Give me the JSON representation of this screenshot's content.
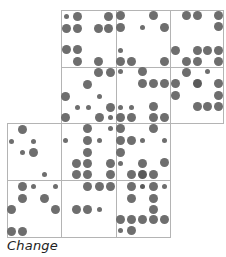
{
  "caption": "Change",
  "colors": {
    "dot": "#6e6e6e",
    "dot_dark": "#5a5a5a",
    "border": "#b4b4b4",
    "background": "#ffffff"
  },
  "cells": [
    {
      "id": "r1c2",
      "x": 61,
      "y": 10,
      "w": 55,
      "h": 57,
      "dots": [
        [
          66,
          16,
          "s"
        ],
        [
          77,
          16,
          "l"
        ],
        [
          108,
          16,
          "l"
        ],
        [
          66,
          28,
          "l"
        ],
        [
          77,
          28,
          "l"
        ],
        [
          98,
          28,
          "l"
        ],
        [
          108,
          28,
          "l"
        ],
        [
          66,
          49,
          "l"
        ],
        [
          77,
          49,
          "l"
        ],
        [
          77,
          61,
          "l"
        ],
        [
          98,
          61,
          "l"
        ]
      ]
    },
    {
      "id": "r1c3",
      "x": 116,
      "y": 10,
      "w": 54,
      "h": 57,
      "dots": [
        [
          120,
          15,
          "l"
        ],
        [
          153,
          15,
          "l"
        ],
        [
          120,
          27,
          "l"
        ],
        [
          142,
          27,
          "s"
        ],
        [
          164,
          27,
          "l"
        ],
        [
          120,
          50,
          "s"
        ],
        [
          120,
          61,
          "l"
        ],
        [
          131,
          61,
          "l"
        ],
        [
          164,
          61,
          "l"
        ]
      ]
    },
    {
      "id": "r1c4",
      "x": 170,
      "y": 10,
      "w": 53,
      "h": 57,
      "dots": [
        [
          186,
          15,
          "l"
        ],
        [
          197,
          15,
          "l"
        ],
        [
          218,
          15,
          "l"
        ],
        [
          218,
          26,
          "l"
        ],
        [
          175,
          50,
          "l"
        ],
        [
          197,
          50,
          "l"
        ],
        [
          207,
          50,
          "l"
        ],
        [
          218,
          50,
          "l"
        ],
        [
          186,
          61,
          "l"
        ],
        [
          197,
          61,
          "l"
        ],
        [
          218,
          61,
          "l"
        ]
      ]
    },
    {
      "id": "r2c2",
      "x": 61,
      "y": 67,
      "w": 55,
      "h": 56,
      "dots": [
        [
          98,
          72,
          "l"
        ],
        [
          110,
          72,
          "l"
        ],
        [
          87,
          84,
          "l"
        ],
        [
          65,
          96,
          "l"
        ],
        [
          99,
          96,
          "s"
        ],
        [
          77,
          107,
          "s"
        ],
        [
          88,
          107,
          "s"
        ],
        [
          110,
          107,
          "l"
        ],
        [
          65,
          117,
          "l"
        ],
        [
          99,
          117,
          "l"
        ],
        [
          110,
          117,
          "s"
        ]
      ]
    },
    {
      "id": "r2c3",
      "x": 116,
      "y": 67,
      "w": 54,
      "h": 56,
      "dots": [
        [
          120,
          71,
          "s"
        ],
        [
          142,
          71,
          "l"
        ],
        [
          142,
          83,
          "l"
        ],
        [
          153,
          83,
          "l"
        ],
        [
          164,
          83,
          "l"
        ],
        [
          120,
          107,
          "s"
        ],
        [
          131,
          107,
          "s"
        ],
        [
          153,
          106,
          "l"
        ],
        [
          120,
          117,
          "l"
        ],
        [
          131,
          117,
          "l"
        ],
        [
          153,
          117,
          "l"
        ],
        [
          164,
          117,
          "l"
        ]
      ]
    },
    {
      "id": "r2c4",
      "x": 170,
      "y": 67,
      "w": 53,
      "h": 56,
      "dots": [
        [
          186,
          72,
          "l"
        ],
        [
          207,
          71,
          "s"
        ],
        [
          175,
          83,
          "l"
        ],
        [
          197,
          83,
          "ld"
        ],
        [
          218,
          83,
          "l"
        ],
        [
          175,
          95,
          "l"
        ],
        [
          218,
          95,
          "l"
        ],
        [
          197,
          106,
          "l"
        ],
        [
          207,
          106,
          "l"
        ],
        [
          218,
          106,
          "l"
        ]
      ]
    },
    {
      "id": "r3c1",
      "x": 7,
      "y": 123,
      "w": 54,
      "h": 57,
      "dots": [
        [
          22,
          129,
          "l"
        ],
        [
          11,
          141,
          "s"
        ],
        [
          33,
          141,
          "s"
        ],
        [
          22,
          152,
          "s"
        ],
        [
          33,
          152,
          "l"
        ],
        [
          44,
          174,
          "s"
        ]
      ]
    },
    {
      "id": "r3c2",
      "x": 61,
      "y": 123,
      "w": 55,
      "h": 57,
      "dots": [
        [
          87,
          128,
          "l"
        ],
        [
          110,
          128,
          "s"
        ],
        [
          65,
          140,
          "s"
        ],
        [
          87,
          140,
          "l"
        ],
        [
          99,
          140,
          "s"
        ],
        [
          87,
          152,
          "l"
        ],
        [
          76,
          163,
          "l"
        ],
        [
          87,
          163,
          "l"
        ],
        [
          110,
          163,
          "l"
        ],
        [
          76,
          174,
          "l"
        ],
        [
          87,
          174,
          "l"
        ],
        [
          110,
          174,
          "l"
        ]
      ]
    },
    {
      "id": "r3c3",
      "x": 116,
      "y": 123,
      "w": 54,
      "h": 57,
      "dots": [
        [
          120,
          128,
          "l"
        ],
        [
          153,
          128,
          "l"
        ],
        [
          120,
          140,
          "l"
        ],
        [
          131,
          140,
          "l"
        ],
        [
          142,
          140,
          "s"
        ],
        [
          164,
          140,
          "s"
        ],
        [
          120,
          152,
          "l"
        ],
        [
          120,
          163,
          "s"
        ],
        [
          142,
          163,
          "l"
        ],
        [
          164,
          162,
          "l"
        ],
        [
          131,
          174,
          "l"
        ],
        [
          142,
          174,
          "ld"
        ],
        [
          153,
          174,
          "l"
        ]
      ]
    },
    {
      "id": "r4c1",
      "x": 7,
      "y": 180,
      "w": 54,
      "h": 57,
      "dots": [
        [
          22,
          186,
          "l"
        ],
        [
          33,
          186,
          "s"
        ],
        [
          55,
          186,
          "s"
        ],
        [
          22,
          198,
          "l"
        ],
        [
          44,
          198,
          "l"
        ],
        [
          11,
          209,
          "l"
        ],
        [
          55,
          209,
          "l"
        ],
        [
          11,
          231,
          "l"
        ],
        [
          22,
          231,
          "l"
        ]
      ]
    },
    {
      "id": "r4c2",
      "x": 61,
      "y": 180,
      "w": 55,
      "h": 57,
      "dots": [
        [
          87,
          186,
          "l"
        ],
        [
          99,
          186,
          "l"
        ],
        [
          110,
          186,
          "l"
        ],
        [
          76,
          209,
          "l"
        ],
        [
          87,
          209,
          "l"
        ],
        [
          99,
          209,
          "s"
        ]
      ]
    },
    {
      "id": "r4c3",
      "x": 116,
      "y": 180,
      "w": 54,
      "h": 57,
      "dots": [
        [
          131,
          186,
          "l"
        ],
        [
          142,
          186,
          "sd"
        ],
        [
          153,
          186,
          "l"
        ],
        [
          164,
          186,
          "s"
        ],
        [
          131,
          198,
          "l"
        ],
        [
          153,
          198,
          "l"
        ],
        [
          153,
          209,
          "l"
        ],
        [
          120,
          219,
          "l"
        ],
        [
          131,
          219,
          "l"
        ],
        [
          142,
          219,
          "l"
        ],
        [
          153,
          219,
          "l"
        ],
        [
          164,
          219,
          "l"
        ],
        [
          120,
          230,
          "s"
        ],
        [
          131,
          230,
          "l"
        ]
      ]
    }
  ]
}
